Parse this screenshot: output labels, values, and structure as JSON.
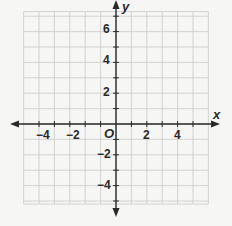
{
  "chart_data": {
    "type": "coordinate-plane",
    "title": "",
    "xlabel": "x",
    "ylabel": "y",
    "origin_label": "O",
    "xlim": [
      -6,
      6
    ],
    "ylim": [
      -6,
      7
    ],
    "grid": true,
    "grid_step": 1,
    "x_tick_labels": [
      "-4",
      "-2",
      "2",
      "4"
    ],
    "y_tick_labels": [
      "6",
      "4",
      "2",
      "-2",
      "-4"
    ],
    "x_tick_values": [
      -4,
      -2,
      2,
      4
    ],
    "y_tick_values": [
      6,
      4,
      2,
      -2,
      -4
    ],
    "points": []
  },
  "labels": {
    "x_axis": "x",
    "y_axis": "y",
    "origin": "O",
    "xt_m4": "−4",
    "xt_m2": "−2",
    "xt_2": "2",
    "xt_4": "4",
    "yt_6": "6",
    "yt_4": "4",
    "yt_2": "2",
    "yt_m2": "−2",
    "yt_m4": "−4"
  },
  "colors": {
    "grid": "#c9c9c9",
    "axis": "#2a2a2a",
    "background": "#f6f6f4"
  }
}
